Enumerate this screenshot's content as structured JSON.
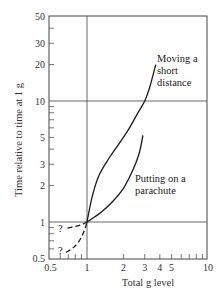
{
  "chart_data": {
    "type": "line",
    "title": "",
    "xlabel": "Total g level",
    "ylabel": "Time relative to time at 1 g",
    "xscale": "log",
    "yscale": "log",
    "xlim": [
      0.5,
      10
    ],
    "ylim": [
      0.5,
      50
    ],
    "x_ticks": [
      0.5,
      1,
      2,
      3,
      4,
      5,
      10
    ],
    "x_tick_labels": [
      "0.5",
      "1",
      "2",
      "3",
      "4",
      "5",
      "10"
    ],
    "y_ticks": [
      0.5,
      1,
      2,
      3,
      5,
      10,
      20,
      30,
      50
    ],
    "y_tick_labels": [
      "0.5",
      "1",
      "2",
      "3",
      "5",
      "10",
      "20",
      "30",
      "50"
    ],
    "reference_lines": {
      "x": [
        1
      ],
      "y": [
        1,
        10
      ]
    },
    "grid": false,
    "legend": "none",
    "series": [
      {
        "name": "Moving a short distance",
        "style": "solid",
        "points": [
          [
            1.0,
            1.0
          ],
          [
            1.1,
            1.6
          ],
          [
            1.25,
            2.4
          ],
          [
            1.5,
            3.3
          ],
          [
            1.8,
            4.3
          ],
          [
            2.2,
            5.8
          ],
          [
            2.6,
            7.8
          ],
          [
            3.0,
            10.0
          ],
          [
            3.3,
            13.0
          ],
          [
            3.7,
            20.0
          ]
        ]
      },
      {
        "name": "Putting on a parachute",
        "style": "solid",
        "points": [
          [
            1.0,
            1.0
          ],
          [
            1.3,
            1.2
          ],
          [
            1.6,
            1.45
          ],
          [
            2.0,
            1.9
          ],
          [
            2.4,
            2.7
          ],
          [
            2.7,
            3.7
          ],
          [
            2.9,
            5.2
          ]
        ]
      },
      {
        "name": "Extrapolation (upper, uncertain)",
        "style": "dashed",
        "points": [
          [
            0.69,
            0.89
          ],
          [
            0.8,
            0.92
          ],
          [
            0.9,
            0.95
          ],
          [
            1.0,
            1.0
          ]
        ]
      },
      {
        "name": "Extrapolation (lower, uncertain)",
        "style": "dashed",
        "points": [
          [
            0.67,
            0.56
          ],
          [
            0.78,
            0.62
          ],
          [
            0.88,
            0.72
          ],
          [
            0.95,
            0.85
          ],
          [
            1.0,
            1.0
          ]
        ]
      }
    ],
    "annotations": [
      {
        "text": "Moving a",
        "x": 3.9,
        "y": 33
      },
      {
        "text": "short",
        "x": 3.9,
        "y": 26
      },
      {
        "text": "distance",
        "x": 3.9,
        "y": 20
      },
      {
        "text": "Putting on a",
        "x": 3.0,
        "y": 2.3
      },
      {
        "text": "parachute",
        "x": 3.0,
        "y": 1.85
      },
      {
        "text": "?",
        "x": 0.62,
        "y": 0.89
      },
      {
        "text": "?",
        "x": 0.61,
        "y": 0.56
      }
    ]
  },
  "labels": {
    "xlabel": "Total g level",
    "ylabel": "Time relative to time at 1 g",
    "moving_1": "Moving a",
    "moving_2": "short",
    "moving_3": "distance",
    "parachute_1": "Putting on a",
    "parachute_2": "parachute",
    "q": "?"
  }
}
